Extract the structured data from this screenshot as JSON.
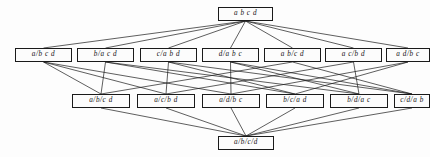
{
  "diagram": {
    "type": "hasse-diagram",
    "background_color": "#fdfdfd",
    "node_fill_color": "#fcfcfc",
    "node_border_color": "#1a1a1a",
    "edge_color": "#1a1a1a",
    "levels": [
      {
        "level": 0,
        "name": "one-block-partition",
        "y": 7,
        "height": 14,
        "nodes": [
          {
            "id": "abcd",
            "label": "a b c d",
            "x": 218,
            "width": 55
          }
        ]
      },
      {
        "level": 1,
        "name": "two-block-partitions",
        "y": 48,
        "height": 14,
        "nodes": [
          {
            "id": "a|bcd",
            "label": "a/b c d",
            "x": 15,
            "width": 57
          },
          {
            "id": "b|acd",
            "label": "b/a c d",
            "x": 77,
            "width": 57
          },
          {
            "id": "c|abd",
            "label": "c/a b d",
            "x": 140,
            "width": 57
          },
          {
            "id": "d|abc",
            "label": "d/a b c",
            "x": 202,
            "width": 57
          },
          {
            "id": "ab|cd",
            "label": "a b/c d",
            "x": 264,
            "width": 57
          },
          {
            "id": "ac|bd",
            "label": "a c/b d",
            "x": 325,
            "width": 57
          },
          {
            "id": "ad|bc",
            "label": "a d/b c",
            "x": 386,
            "width": 44
          }
        ]
      },
      {
        "level": 2,
        "name": "three-block-partitions",
        "y": 94,
        "height": 14,
        "nodes": [
          {
            "id": "a|b|cd",
            "label": "a/b/c d",
            "x": 72,
            "width": 58
          },
          {
            "id": "a|c|bd",
            "label": "a/c/b d",
            "x": 137,
            "width": 58
          },
          {
            "id": "a|d|bc",
            "label": "a/d/b c",
            "x": 202,
            "width": 58
          },
          {
            "id": "b|c|ad",
            "label": "b/c/a d",
            "x": 266,
            "width": 58
          },
          {
            "id": "b|d|ac",
            "label": "b/d/a c",
            "x": 330,
            "width": 58
          },
          {
            "id": "c|d|ab",
            "label": "c/d/a b",
            "x": 394,
            "width": 36
          }
        ]
      },
      {
        "level": 3,
        "name": "four-block-partition",
        "y": 136,
        "height": 14,
        "nodes": [
          {
            "id": "a|b|c|d",
            "label": "a/b/c/d",
            "x": 218,
            "width": 56
          }
        ]
      }
    ],
    "edges": [
      {
        "from": "abcd",
        "to": "a|bcd"
      },
      {
        "from": "abcd",
        "to": "b|acd"
      },
      {
        "from": "abcd",
        "to": "c|abd"
      },
      {
        "from": "abcd",
        "to": "d|abc"
      },
      {
        "from": "abcd",
        "to": "ab|cd"
      },
      {
        "from": "abcd",
        "to": "ac|bd"
      },
      {
        "from": "abcd",
        "to": "ad|bc"
      },
      {
        "from": "a|bcd",
        "to": "a|b|cd"
      },
      {
        "from": "a|bcd",
        "to": "a|c|bd"
      },
      {
        "from": "a|bcd",
        "to": "a|d|bc"
      },
      {
        "from": "b|acd",
        "to": "a|b|cd"
      },
      {
        "from": "b|acd",
        "to": "b|c|ad"
      },
      {
        "from": "b|acd",
        "to": "b|d|ac"
      },
      {
        "from": "c|abd",
        "to": "a|c|bd"
      },
      {
        "from": "c|abd",
        "to": "b|c|ad"
      },
      {
        "from": "c|abd",
        "to": "c|d|ab"
      },
      {
        "from": "d|abc",
        "to": "a|d|bc"
      },
      {
        "from": "d|abc",
        "to": "b|d|ac"
      },
      {
        "from": "d|abc",
        "to": "c|d|ab"
      },
      {
        "from": "ab|cd",
        "to": "a|b|cd"
      },
      {
        "from": "ab|cd",
        "to": "c|d|ab"
      },
      {
        "from": "ac|bd",
        "to": "a|c|bd"
      },
      {
        "from": "ac|bd",
        "to": "b|d|ac"
      },
      {
        "from": "ad|bc",
        "to": "a|d|bc"
      },
      {
        "from": "ad|bc",
        "to": "b|c|ad"
      },
      {
        "from": "a|b|cd",
        "to": "a|b|c|d"
      },
      {
        "from": "a|c|bd",
        "to": "a|b|c|d"
      },
      {
        "from": "a|d|bc",
        "to": "a|b|c|d"
      },
      {
        "from": "b|c|ad",
        "to": "a|b|c|d"
      },
      {
        "from": "b|d|ac",
        "to": "a|b|c|d"
      },
      {
        "from": "c|d|ab",
        "to": "a|b|c|d"
      }
    ]
  }
}
